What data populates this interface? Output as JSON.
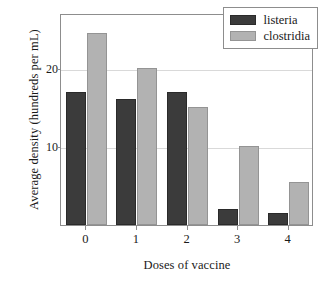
{
  "chart_data": {
    "type": "bar",
    "title": "",
    "xlabel": "Doses of vaccine",
    "ylabel": "Average density (hundreds per mL)",
    "categories": [
      "0",
      "1",
      "2",
      "3",
      "4"
    ],
    "series": [
      {
        "name": "listeria",
        "color": "#3b3b3b",
        "values": [
          17,
          16,
          17,
          2,
          1.5
        ]
      },
      {
        "name": "clostridia",
        "color": "#b2b2b2",
        "values": [
          24.5,
          20,
          15,
          10,
          5.5
        ]
      }
    ],
    "ylim": [
      0,
      27
    ],
    "yticks": [
      10,
      20
    ],
    "ytick_labels": [
      "10",
      "20"
    ],
    "grid": true,
    "legend_position": "top-right",
    "legend_entries": [
      "listeria",
      "clostridia"
    ]
  }
}
